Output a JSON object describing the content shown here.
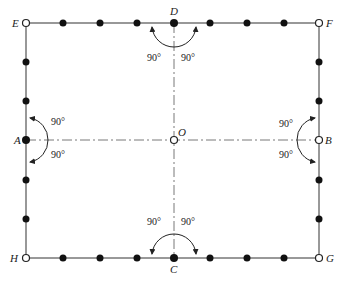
{
  "diagram": {
    "type": "rectangle-layout-with-axes",
    "colors": {
      "line": "#333333",
      "dot": "#111111",
      "background": "#ffffff"
    },
    "corners": [
      {
        "id": "E",
        "label": "E",
        "x": 26,
        "y": 23,
        "style": "open"
      },
      {
        "id": "F",
        "label": "F",
        "x": 319,
        "y": 23,
        "style": "open"
      },
      {
        "id": "G",
        "label": "G",
        "x": 319,
        "y": 258,
        "style": "open"
      },
      {
        "id": "H",
        "label": "H",
        "x": 26,
        "y": 258,
        "style": "open"
      }
    ],
    "midpoints": [
      {
        "id": "D",
        "label": "D",
        "x": 174,
        "y": 23,
        "style": "filled"
      },
      {
        "id": "C",
        "label": "C",
        "x": 174,
        "y": 258,
        "style": "filled"
      },
      {
        "id": "A",
        "label": "A",
        "x": 26,
        "y": 140,
        "style": "filled"
      },
      {
        "id": "B",
        "label": "B",
        "x": 319,
        "y": 140,
        "style": "open"
      },
      {
        "id": "O",
        "label": "O",
        "x": 174,
        "y": 140,
        "style": "open"
      }
    ],
    "angle_labels": {
      "D_left": "90°",
      "D_right": "90°",
      "C_left": "90°",
      "C_right": "90°",
      "A_top": "90°",
      "A_bottom": "90°",
      "B_top": "90°",
      "B_bottom": "90°"
    },
    "dots_count_per_side": {
      "top": 7,
      "bottom": 7,
      "left": 5,
      "right": 5
    }
  }
}
